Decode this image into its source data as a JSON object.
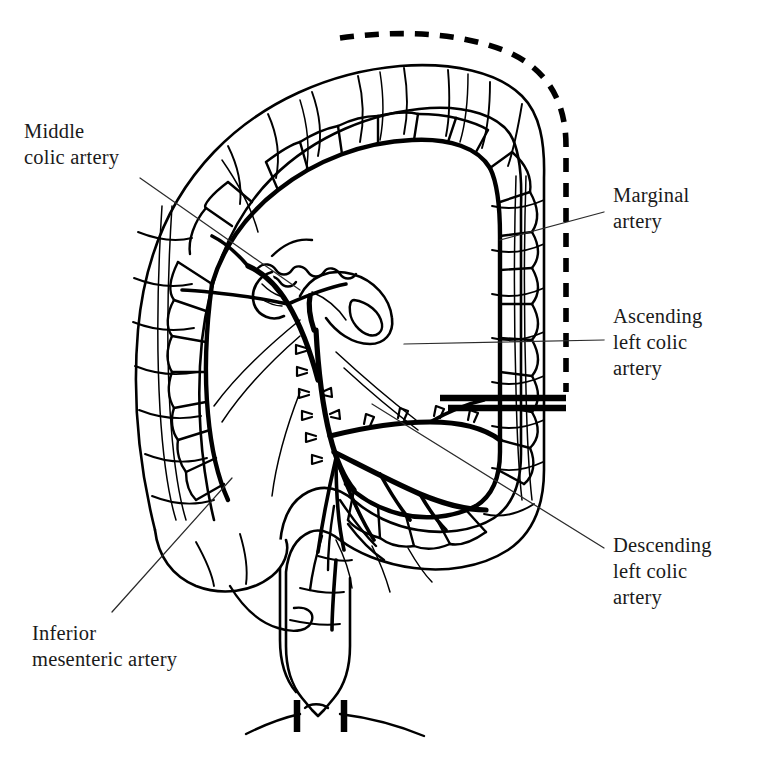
{
  "figure": {
    "kind": "anatomical-line-drawing",
    "background_color": "#ffffff",
    "ink_color": "#000000",
    "label_text_color": "#1a1a1a"
  },
  "labels": {
    "middle_colic": "Middle\ncolic artery",
    "marginal": "Marginal\nartery",
    "ascending_left_colic": "Ascending\nleft colic\nartery",
    "descending_left_colic": "Descending\nleft colic\nartery",
    "inferior_mesenteric": "Inferior\nmesenteric artery"
  },
  "anatomy": {
    "structures": [
      "transverse colon",
      "ascending colon",
      "cecum",
      "appendix",
      "hepatic flexure",
      "splenic flexure",
      "descending colon",
      "sigmoid colon",
      "rectum",
      "mesentery",
      "small bowel stump"
    ],
    "vessels": [
      "middle colic artery",
      "marginal artery",
      "ascending left colic artery",
      "descending left colic artery",
      "inferior mesenteric artery",
      "sigmoid arteries",
      "vasa recta"
    ],
    "markings": [
      "dashed resection line along descending colon",
      "transection bar across descending colon",
      "surgical ligature clips along inferior mesenteric artery",
      "rectal transection marks"
    ]
  }
}
